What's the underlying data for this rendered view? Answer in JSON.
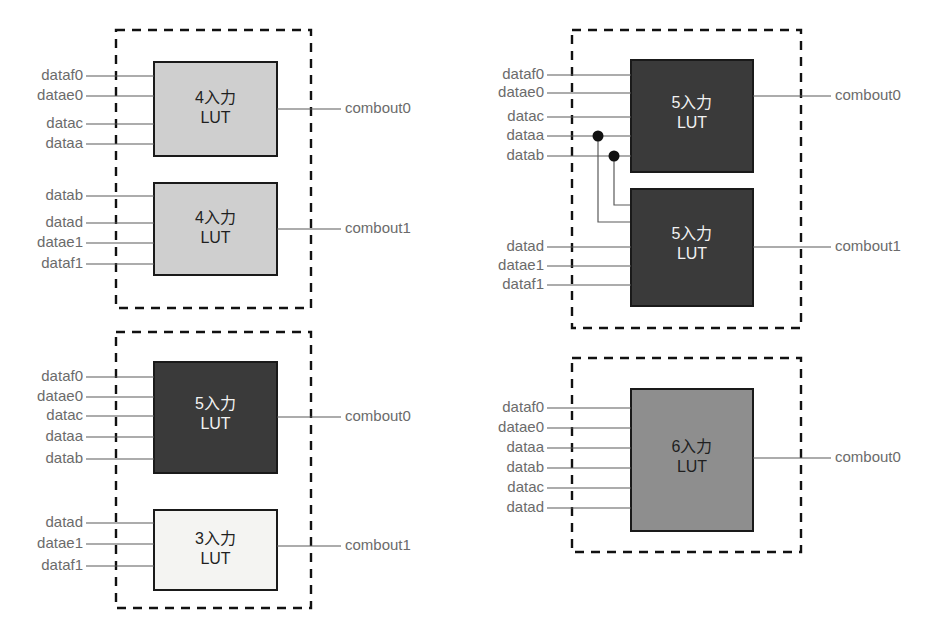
{
  "diagram": {
    "colors": {
      "wire": "#5a5a5a",
      "group_border": "#111111",
      "lut_border": "#1a1a1a",
      "fill_light": "#f4f4f2",
      "fill_mid": "#cfcfcf",
      "fill_gray": "#8e8e8e",
      "fill_dark": "#3a3a3a",
      "label_text": "#6b6b6b",
      "background": "#ffffff"
    },
    "groups": [
      {
        "id": "group-top-left",
        "luts": [
          {
            "id": "lut-tl-0",
            "title_line1": "4入力",
            "title_line2": "LUT",
            "shade": "mid",
            "inputs": [
              "dataf0",
              "datae0",
              "datac",
              "dataa"
            ],
            "output": "combout0"
          },
          {
            "id": "lut-tl-1",
            "title_line1": "4入力",
            "title_line2": "LUT",
            "shade": "mid",
            "inputs": [
              "datab",
              "datad",
              "datae1",
              "dataf1"
            ],
            "output": "combout1"
          }
        ]
      },
      {
        "id": "group-top-right",
        "luts": [
          {
            "id": "lut-tr-0",
            "title_line1": "5入力",
            "title_line2": "LUT",
            "shade": "dark",
            "inputs": [
              "dataf0",
              "datae0",
              "datac",
              "dataa",
              "datab"
            ],
            "output": "combout0"
          },
          {
            "id": "lut-tr-1",
            "title_line1": "5入力",
            "title_line2": "LUT",
            "shade": "dark",
            "inputs": [
              "datad",
              "datae1",
              "dataf1"
            ],
            "shared_inputs": [
              "dataa",
              "datab"
            ],
            "output": "combout1"
          }
        ],
        "junctions": [
          "dataa",
          "datab"
        ]
      },
      {
        "id": "group-bottom-left",
        "luts": [
          {
            "id": "lut-bl-0",
            "title_line1": "5入力",
            "title_line2": "LUT",
            "shade": "dark",
            "inputs": [
              "dataf0",
              "datae0",
              "datac",
              "dataa",
              "datab"
            ],
            "output": "combout0"
          },
          {
            "id": "lut-bl-1",
            "title_line1": "3入力",
            "title_line2": "LUT",
            "shade": "light",
            "inputs": [
              "datad",
              "datae1",
              "dataf1"
            ],
            "output": "combout1"
          }
        ]
      },
      {
        "id": "group-bottom-right",
        "luts": [
          {
            "id": "lut-br-0",
            "title_line1": "6入力",
            "title_line2": "LUT",
            "shade": "gray",
            "inputs": [
              "dataf0",
              "datae0",
              "dataa",
              "datab",
              "datac",
              "datad"
            ],
            "output": "combout0"
          }
        ]
      }
    ]
  }
}
